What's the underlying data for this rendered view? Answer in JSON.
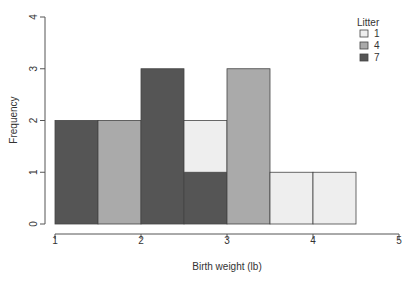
{
  "chart_data": {
    "type": "bar",
    "subtype": "stacked-histogram",
    "title": "",
    "xlabel": "Birth weight (lb)",
    "ylabel": "Frequency",
    "xlim": [
      1,
      5
    ],
    "ylim": [
      0,
      4
    ],
    "xticks": [
      "1",
      "2",
      "3",
      "4",
      "5"
    ],
    "yticks": [
      "0",
      "1",
      "2",
      "3",
      "4"
    ],
    "grid": false,
    "legend": {
      "title": "Litter",
      "position": "top-right",
      "entries": [
        "1",
        "4",
        "7"
      ]
    },
    "bins": [
      {
        "from": 1.0,
        "to": 1.5
      },
      {
        "from": 1.5,
        "to": 2.0
      },
      {
        "from": 2.0,
        "to": 2.5
      },
      {
        "from": 2.5,
        "to": 3.0
      },
      {
        "from": 3.0,
        "to": 3.5
      },
      {
        "from": 3.5,
        "to": 4.0
      },
      {
        "from": 4.0,
        "to": 4.5
      }
    ],
    "categories": [
      "1-1.5",
      "1.5-2",
      "2-2.5",
      "2.5-3",
      "3-3.5",
      "3.5-4",
      "4-4.5"
    ],
    "series": [
      {
        "name": "7",
        "color": "#555555",
        "values": [
          2,
          0,
          3,
          1,
          0,
          0,
          0
        ]
      },
      {
        "name": "4",
        "color": "#aaaaaa",
        "values": [
          0,
          2,
          0,
          0,
          3,
          0,
          0
        ]
      },
      {
        "name": "1",
        "color": "#eeeeee",
        "values": [
          0,
          0,
          0,
          1,
          0,
          1,
          1
        ]
      }
    ]
  }
}
